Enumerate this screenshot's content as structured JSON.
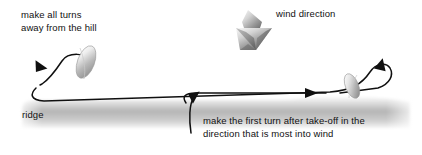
{
  "diagram": {
    "background_color": "#ffffff",
    "line_color": "#101010",
    "text_color": "#111111",
    "ridge_color_light": "#f2f2f2",
    "ridge_color_mid": "#bdbdbd",
    "ridge_color_dark": "#9a9a9a",
    "arrow_color_light": "#e8e8e8",
    "arrow_color_dark": "#5a5a5a",
    "glider_color_light": "#ffffff",
    "glider_color_dark": "#8f8f8f"
  },
  "labels": {
    "turns_away_line1": "make all turns",
    "turns_away_line2": "away from the hill",
    "wind_direction": "wind direction",
    "ridge": "ridge",
    "first_turn_line1": "make the first turn after take-off in the",
    "first_turn_line2": "direction that is most into wind"
  },
  "elements": {
    "wind_arrow_name": "wind-direction-arrow-icon",
    "glider_left_name": "glider-left-icon",
    "glider_right_name": "glider-right-icon",
    "ridge_band_name": "ridge-terrain-band",
    "flight_path_name": "flight-path-circuit",
    "takeoff_path_name": "takeoff-path",
    "arrowhead_left_name": "flight-arrowhead-left",
    "arrowhead_right_name": "flight-arrowhead-right",
    "arrowhead_mid_name": "flight-arrowhead-middle",
    "arrowhead_takeoff_name": "takeoff-arrowhead"
  }
}
